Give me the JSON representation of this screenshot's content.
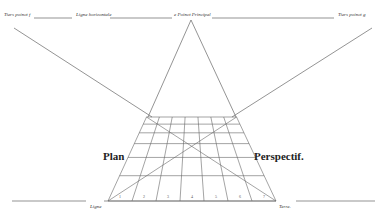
{
  "diagram": {
    "labels": {
      "left_distance_point": "Tiers poinct f",
      "horizon_line": "Ligne horizontale",
      "principal_point": "e Poinct Principal",
      "right_distance_point": "Tiers poinct g",
      "plan": "Plan",
      "perspective": "Perspectif.",
      "ground_line_left": "Ligne",
      "ground_line_right": "Terre."
    },
    "grid": {
      "columns": 7,
      "rows": 6,
      "base_numbers": [
        "1",
        "2",
        "3",
        "4",
        "5",
        "6",
        "7"
      ]
    },
    "colors": {
      "ink": "#555555",
      "background": "#ffffff"
    }
  }
}
